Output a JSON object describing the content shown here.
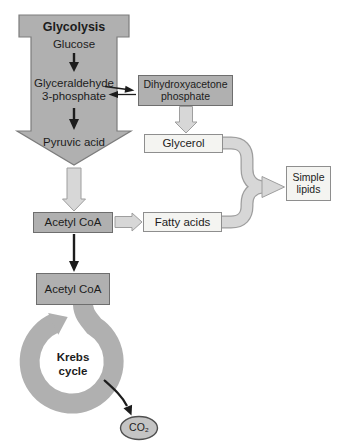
{
  "colors": {
    "bg": "#ffffff",
    "gray_fill": "#b0b0b0",
    "gray_border": "#6e6e6e",
    "arrow_outline": "#7c7c7c",
    "light_fill": "#f4f4f1",
    "light_border": "#8e8e8e",
    "flow_fill": "#d7d7d7",
    "flow_outline": "#9e9e9e",
    "ink": "#1c1c1c",
    "co2_fill": "#c4c4c4",
    "co2_border": "#4f4f4f"
  },
  "glycolysis": {
    "title": "Glycolysis",
    "glucose": "Glucose",
    "g3p_line1": "Glyceraldehyde",
    "g3p_line2": "3-phosphate",
    "pyruvic_acid": "Pyruvic acid"
  },
  "nodes": {
    "dhap": {
      "line1": "Dihydroxyacetone",
      "line2": "phosphate"
    },
    "glycerol": "Glycerol",
    "simple_lipids": {
      "line1": "Simple",
      "line2": "lipids"
    },
    "acetyl_coa_upper": "Acetyl CoA",
    "fatty_acids": "Fatty acids",
    "acetyl_coa_lower": "Acetyl CoA",
    "krebs": {
      "line1": "Krebs",
      "line2": "cycle"
    },
    "co2": "CO₂"
  }
}
